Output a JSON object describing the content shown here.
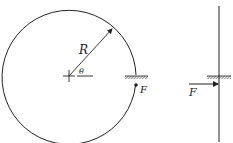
{
  "figure_left": {
    "labels": {
      "radius": "R",
      "angle": "θ",
      "force": "F"
    },
    "elements": [
      "circle",
      "radius-arrow",
      "center-cross",
      "angle-reference-line",
      "hatched-support",
      "force-point"
    ]
  },
  "figure_right": {
    "labels": {
      "force": "F"
    },
    "elements": [
      "vertical-rod",
      "hatched-support",
      "force-arrow"
    ]
  },
  "colors": {
    "stroke": "#222222",
    "background": "#ffffff"
  }
}
